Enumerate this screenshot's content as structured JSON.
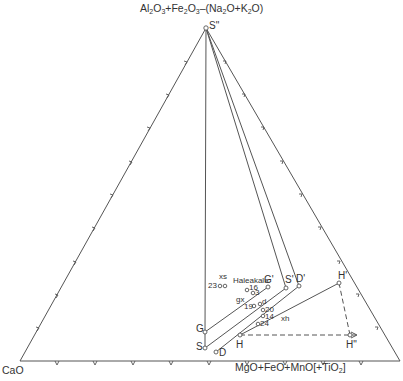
{
  "diagram": {
    "type": "ternary",
    "vertices": {
      "top": {
        "formula_parts": [
          "Al",
          "2",
          "O",
          "3",
          "+Fe",
          "2",
          "O",
          "3",
          "–(Na",
          "2",
          "O+K",
          "2",
          "O)"
        ],
        "text": "Al2O3+Fe2O3–(Na2O+K2O)"
      },
      "left": {
        "text": "CaO"
      },
      "right": {
        "text": "MgO+FeO+MnO[+TiO2]"
      }
    },
    "points": {
      "S2": "S\"",
      "G": "G",
      "S": "S",
      "D": "D",
      "H": "H",
      "G1": "G'",
      "S1": "S'",
      "D1": "D'",
      "H1": "H'",
      "H2": "H\""
    },
    "samples": {
      "haleakala": "Haleakala",
      "n23": "23",
      "xs": "xs",
      "n16": "16",
      "n3": "3",
      "gx": "gx",
      "n19": "19",
      "d": "d",
      "n20": "20",
      "n14": "14",
      "xh": "xh",
      "n24": "24"
    },
    "line_color": "#555555"
  }
}
